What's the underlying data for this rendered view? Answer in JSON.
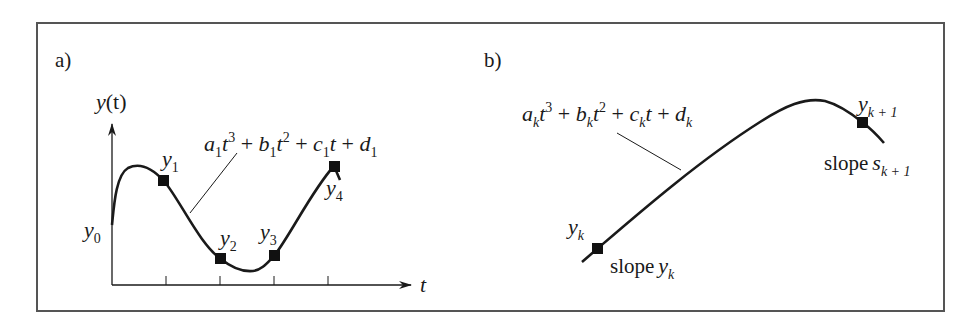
{
  "figure": {
    "frame_color": "#555555",
    "curve_color": "#1a1a1a",
    "panel_a": {
      "label": "a)",
      "y_axis_label": {
        "var": "y",
        "arg": "(t)"
      },
      "x_axis_label": "t",
      "tick_count": 4,
      "equation": {
        "terms": [
          {
            "coef": "a",
            "sub": "1",
            "var": "t",
            "pow": "3"
          },
          {
            "coef": "b",
            "sub": "1",
            "var": "t",
            "pow": "2"
          },
          {
            "coef": "c",
            "sub": "1",
            "var": "t",
            "pow": ""
          },
          {
            "coef": "d",
            "sub": "1",
            "var": "",
            "pow": ""
          }
        ],
        "operator": "+"
      },
      "points": [
        {
          "name": "y",
          "sub": "0"
        },
        {
          "name": "y",
          "sub": "1"
        },
        {
          "name": "y",
          "sub": "2"
        },
        {
          "name": "y",
          "sub": "3"
        },
        {
          "name": "y",
          "sub": "4"
        }
      ]
    },
    "panel_b": {
      "label": "b)",
      "equation": {
        "terms": [
          {
            "coef": "a",
            "sub": "k",
            "var": "t",
            "pow": "3"
          },
          {
            "coef": "b",
            "sub": "k",
            "var": "t",
            "pow": "2"
          },
          {
            "coef": "c",
            "sub": "k",
            "var": "t",
            "pow": ""
          },
          {
            "coef": "d",
            "sub": "k",
            "var": "",
            "pow": ""
          }
        ],
        "operator": "+"
      },
      "start_point": {
        "name": "y",
        "sub": "k",
        "slope_word": "slope",
        "slope_var": "y",
        "slope_sub": "k"
      },
      "end_point": {
        "name": "y",
        "sub": "k + 1",
        "slope_word": "slope",
        "slope_var": "s",
        "slope_sub": "k + 1"
      }
    }
  }
}
